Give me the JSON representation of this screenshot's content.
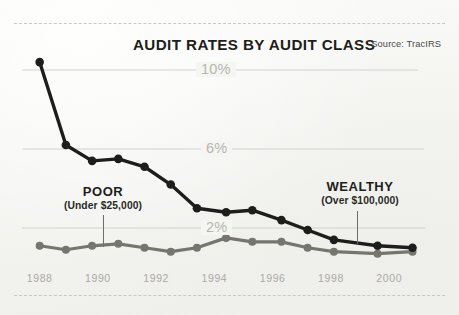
{
  "chart_data": {
    "type": "line",
    "title": "AUDIT RATES BY AUDIT CLASS",
    "source": "Source: TracIRS",
    "xlabel": "",
    "ylabel": "",
    "grid": true,
    "legend_position": "inline-annotations",
    "ylim": [
      0,
      11.2
    ],
    "yticks": [
      2,
      6,
      10
    ],
    "ytick_labels": [
      "2%",
      "6%",
      "10%"
    ],
    "xlim": [
      1987.6,
      2001.4
    ],
    "xticks": [
      1988,
      1990,
      1992,
      1994,
      1996,
      1998,
      2000
    ],
    "xtick_labels": [
      "1988",
      "1990",
      "1992",
      "1994",
      "1996",
      "1998",
      "2000"
    ],
    "x": [
      1988,
      1988.9,
      1989.8,
      1990.7,
      1991.6,
      1992.5,
      1993.4,
      1994.4,
      1995.3,
      1996.3,
      1997.2,
      1998.1,
      1999.6,
      2000.8
    ],
    "series": [
      {
        "name": "WEALTHY",
        "note": "(Over $100,000)",
        "color": "#1d1d1b",
        "values": [
          10.4,
          6.2,
          5.4,
          5.5,
          5.1,
          4.2,
          3.0,
          2.8,
          2.9,
          2.4,
          1.9,
          1.4,
          1.1,
          1.0
        ]
      },
      {
        "name": "POOR",
        "note": "(Under $25,000)",
        "color": "#76766f",
        "values": [
          1.1,
          0.9,
          1.1,
          1.2,
          1.0,
          0.8,
          1.0,
          1.5,
          1.3,
          1.3,
          1.0,
          0.8,
          0.7,
          0.8
        ]
      }
    ],
    "annotations": [
      {
        "title": "POOR",
        "subtitle": "(Under $25,000)",
        "points_to_series": "POOR"
      },
      {
        "title": "WEALTHY",
        "subtitle": "(Over $100,000)",
        "points_to_series": "WEALTHY"
      }
    ]
  }
}
